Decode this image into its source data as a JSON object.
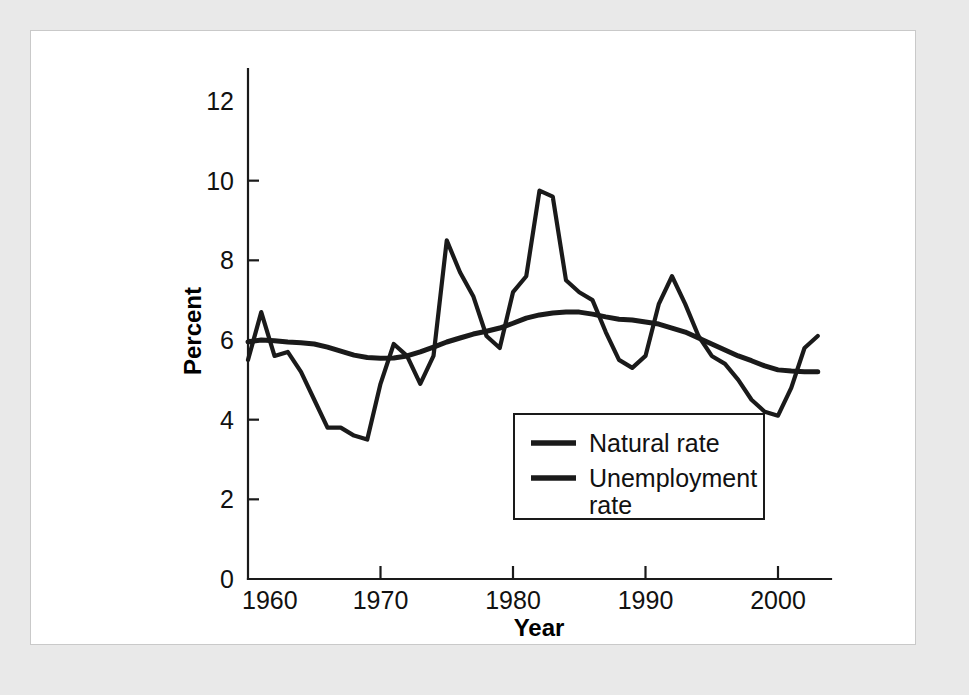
{
  "figure": {
    "background_color": "#e9e9e9",
    "panel_color": "#ffffff",
    "ink_color": "#1a1a1a"
  },
  "chart_data": {
    "type": "line",
    "title": "",
    "xlabel": "Year",
    "ylabel": "Percent",
    "xlim": [
      1960,
      2004
    ],
    "ylim": [
      0,
      12
    ],
    "xticks": [
      1960,
      1970,
      1980,
      1990,
      2000
    ],
    "xtick_labels": [
      "1960",
      "1970",
      "1980",
      "1990",
      "2000"
    ],
    "yticks": [
      0,
      2,
      4,
      6,
      8,
      10,
      12
    ],
    "ytick_labels": [
      "0",
      "2",
      "4",
      "6",
      "8",
      "10",
      "12"
    ],
    "grid": false,
    "legend_position": "lower-center-right",
    "x": [
      1960,
      1961,
      1962,
      1963,
      1964,
      1965,
      1966,
      1967,
      1968,
      1969,
      1970,
      1971,
      1972,
      1973,
      1974,
      1975,
      1976,
      1977,
      1978,
      1979,
      1980,
      1981,
      1982,
      1983,
      1984,
      1985,
      1986,
      1987,
      1988,
      1989,
      1990,
      1991,
      1992,
      1993,
      1994,
      1995,
      1996,
      1997,
      1998,
      1999,
      2000,
      2001,
      2002,
      2003
    ],
    "series": [
      {
        "name": "Natural rate",
        "line_style": "solid",
        "color": "#1a1a1a",
        "values": [
          5.95,
          6.0,
          5.98,
          5.95,
          5.93,
          5.9,
          5.82,
          5.72,
          5.62,
          5.56,
          5.54,
          5.55,
          5.6,
          5.7,
          5.82,
          5.95,
          6.05,
          6.15,
          6.22,
          6.3,
          6.42,
          6.55,
          6.63,
          6.68,
          6.7,
          6.7,
          6.65,
          6.58,
          6.52,
          6.5,
          6.45,
          6.4,
          6.3,
          6.2,
          6.05,
          5.9,
          5.75,
          5.6,
          5.48,
          5.35,
          5.25,
          5.22,
          5.2,
          5.2
        ]
      },
      {
        "name": "Unemployment rate",
        "line_style": "solid",
        "color": "#1a1a1a",
        "values": [
          5.5,
          6.7,
          5.6,
          5.7,
          5.2,
          4.5,
          3.8,
          3.8,
          3.6,
          3.5,
          4.9,
          5.9,
          5.6,
          4.9,
          5.6,
          8.5,
          7.7,
          7.1,
          6.1,
          5.8,
          7.2,
          7.6,
          9.75,
          9.6,
          7.5,
          7.2,
          7.0,
          6.2,
          5.5,
          5.3,
          5.6,
          6.9,
          7.6,
          6.9,
          6.1,
          5.6,
          5.4,
          5.0,
          4.5,
          4.2,
          4.1,
          4.8,
          5.8,
          6.1
        ]
      }
    ]
  },
  "legend": {
    "entries": [
      {
        "label": "Natural rate"
      },
      {
        "label": "Unemployment",
        "label_line2": "rate"
      }
    ]
  }
}
